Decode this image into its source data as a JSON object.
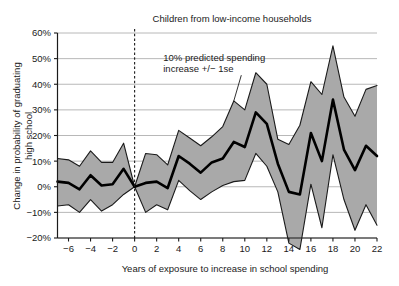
{
  "chart_data": {
    "type": "line",
    "title": "Children from low-income households",
    "xlabel": "Years of exposure to increase in school spending",
    "ylabel_line1": "Change in probability of graduating",
    "ylabel_line2": "high school",
    "xlim": [
      -7,
      22
    ],
    "ylim": [
      -20,
      60
    ],
    "xticks": [
      -6,
      -4,
      -2,
      0,
      2,
      4,
      6,
      8,
      10,
      12,
      14,
      16,
      18,
      20,
      22
    ],
    "xtick_labels": [
      "−6",
      "−4",
      "−2",
      "0",
      "2",
      "4",
      "6",
      "8",
      "10",
      "12",
      "14",
      "16",
      "18",
      "20",
      "22"
    ],
    "yticks": [
      -20,
      -10,
      0,
      10,
      20,
      30,
      40,
      50,
      60
    ],
    "ytick_labels": [
      "−20%",
      "−10%",
      "0%",
      "10%",
      "20%",
      "30%",
      "40%",
      "50%",
      "60%"
    ],
    "grid": "horizontal",
    "legend": "none",
    "reference_line_x": 0,
    "reference_line_style": "dashed",
    "annotation": {
      "line1": "10% predicted spending",
      "line2": "increase +/− 1se",
      "x": 2.6,
      "y": 49,
      "pointer_to_x": 9.0,
      "pointer_to_y": 33.5
    },
    "colors": {
      "band_fill": "#a9a9a9",
      "band_edge": "#1a1a1a",
      "line": "#000000",
      "grid": "#b0b0b0",
      "axis": "#1a1a1a",
      "background": "#ffffff"
    },
    "x": [
      -7,
      -6,
      -5,
      -4,
      -3,
      -2,
      -1,
      0,
      1,
      2,
      3,
      4,
      5,
      6,
      7,
      8,
      9,
      10,
      11,
      12,
      13,
      14,
      15,
      16,
      17,
      18,
      19,
      20,
      21,
      22
    ],
    "series": [
      {
        "name": "Estimate",
        "values": [
          2,
          1.5,
          -1,
          4.5,
          0.5,
          1,
          7,
          0,
          1.5,
          2,
          -0.5,
          12,
          9,
          5.5,
          9.5,
          11,
          17.5,
          15.5,
          29,
          24.5,
          9,
          -2,
          -3,
          21,
          10,
          34,
          14.5,
          6.5,
          16,
          12
        ]
      },
      {
        "name": "Upper (+1se)",
        "values": [
          11,
          10.5,
          8,
          14,
          9.5,
          9.5,
          17,
          0,
          13,
          12.5,
          8.5,
          22,
          19,
          16,
          19.5,
          23.5,
          33.5,
          30,
          44.5,
          40,
          18.5,
          16.5,
          24,
          41,
          36,
          55,
          35,
          27.5,
          38,
          39.5
        ]
      },
      {
        "name": "Lower (−1se)",
        "values": [
          -7.5,
          -7,
          -10,
          -5,
          -9.5,
          -7,
          -3,
          0,
          -10,
          -7,
          -9,
          2.5,
          -1.5,
          -5,
          -2,
          0.5,
          2,
          2.5,
          13,
          8,
          -2,
          -22,
          -24.5,
          1,
          -16,
          12.5,
          -5,
          -17,
          -7,
          -15
        ]
      }
    ]
  }
}
